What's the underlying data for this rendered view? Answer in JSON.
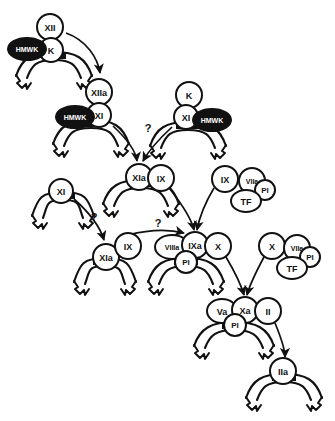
{
  "diagram": {
    "type": "biochemical-pathway",
    "background_color": "#ffffff",
    "stroke_color": "#111111",
    "dark_fill_color": "#111111",
    "light_fill_color": "#ffffff",
    "nodes": [
      {
        "id": "n1",
        "label": "XII",
        "shape": "circle",
        "style": "light",
        "cx": 50,
        "cy": 27,
        "r": 13,
        "font": 9
      },
      {
        "id": "n2",
        "label": "K",
        "shape": "circle",
        "style": "light",
        "cx": 51,
        "cy": 50,
        "r": 12,
        "font": 9
      },
      {
        "id": "n3",
        "label": "HMWK",
        "shape": "ellipse",
        "style": "dark",
        "cx": 27,
        "cy": 49,
        "rx": 19,
        "ry": 11,
        "font": 7
      },
      {
        "id": "n4",
        "label": "XIIa",
        "shape": "circle",
        "style": "light",
        "cx": 99,
        "cy": 92,
        "r": 13,
        "font": 9
      },
      {
        "id": "n5",
        "label": "XI",
        "shape": "circle",
        "style": "light",
        "cx": 99,
        "cy": 115,
        "r": 12,
        "font": 9
      },
      {
        "id": "n6",
        "label": "HMWK",
        "shape": "ellipse",
        "style": "dark",
        "cx": 75,
        "cy": 117,
        "rx": 19,
        "ry": 11,
        "font": 7
      },
      {
        "id": "n7",
        "label": "K",
        "shape": "circle",
        "style": "light",
        "cx": 189,
        "cy": 95,
        "r": 13,
        "font": 9
      },
      {
        "id": "n8",
        "label": "XI",
        "shape": "circle",
        "style": "light",
        "cx": 186,
        "cy": 117,
        "r": 12,
        "font": 9
      },
      {
        "id": "n9",
        "label": "HMWK",
        "shape": "ellipse",
        "style": "dark",
        "cx": 212,
        "cy": 120,
        "rx": 19,
        "ry": 11,
        "font": 7
      },
      {
        "id": "n10",
        "label": "XIa",
        "shape": "circle",
        "style": "light",
        "cx": 139,
        "cy": 177,
        "r": 13,
        "font": 9
      },
      {
        "id": "n11",
        "label": "IX",
        "shape": "circle",
        "style": "light",
        "cx": 161,
        "cy": 178,
        "r": 13,
        "font": 9
      },
      {
        "id": "n12",
        "label": "XI",
        "shape": "circle",
        "style": "light",
        "cx": 61,
        "cy": 191,
        "r": 12,
        "font": 9
      },
      {
        "id": "n13",
        "label": "XIa",
        "shape": "circle",
        "style": "light",
        "cx": 106,
        "cy": 257,
        "r": 13,
        "font": 9
      },
      {
        "id": "n14",
        "label": "IX",
        "shape": "circle",
        "style": "light",
        "cx": 128,
        "cy": 246,
        "r": 13,
        "font": 9
      },
      {
        "id": "n15",
        "label": "IX",
        "shape": "circle",
        "style": "light",
        "cx": 225,
        "cy": 179,
        "r": 13,
        "font": 9
      },
      {
        "id": "n16",
        "label": "VIIa",
        "shape": "circle",
        "style": "light",
        "cx": 252,
        "cy": 181,
        "r": 13,
        "font": 7
      },
      {
        "id": "n17",
        "label": "Pl",
        "shape": "circle",
        "style": "light",
        "cx": 265,
        "cy": 190,
        "r": 10,
        "font": 8
      },
      {
        "id": "n18",
        "label": "TF",
        "shape": "ellipse",
        "style": "light",
        "cx": 246,
        "cy": 201,
        "rx": 15,
        "ry": 11,
        "font": 9
      },
      {
        "id": "n19",
        "label": "VIIIa",
        "shape": "ellipse",
        "style": "light",
        "cx": 172,
        "cy": 247,
        "rx": 17,
        "ry": 12,
        "font": 7
      },
      {
        "id": "n20",
        "label": "IXa",
        "shape": "circle",
        "style": "light",
        "cx": 195,
        "cy": 245,
        "r": 13,
        "font": 9
      },
      {
        "id": "n21",
        "label": "Pl",
        "shape": "circle",
        "style": "light",
        "cx": 186,
        "cy": 262,
        "r": 11,
        "font": 8
      },
      {
        "id": "n22",
        "label": "X",
        "shape": "circle",
        "style": "light",
        "cx": 218,
        "cy": 246,
        "r": 13,
        "font": 9
      },
      {
        "id": "n23",
        "label": "X",
        "shape": "circle",
        "style": "light",
        "cx": 272,
        "cy": 246,
        "r": 13,
        "font": 9
      },
      {
        "id": "n24",
        "label": "VIIa",
        "shape": "circle",
        "style": "light",
        "cx": 297,
        "cy": 248,
        "r": 13,
        "font": 7
      },
      {
        "id": "n25",
        "label": "Pl",
        "shape": "circle",
        "style": "light",
        "cx": 310,
        "cy": 257,
        "r": 10,
        "font": 8
      },
      {
        "id": "n26",
        "label": "TF",
        "shape": "ellipse",
        "style": "light",
        "cx": 292,
        "cy": 268,
        "rx": 15,
        "ry": 11,
        "font": 9
      },
      {
        "id": "n27",
        "label": "Va",
        "shape": "ellipse",
        "style": "light",
        "cx": 222,
        "cy": 311,
        "rx": 15,
        "ry": 12,
        "font": 9
      },
      {
        "id": "n28",
        "label": "Xa",
        "shape": "circle",
        "style": "light",
        "cx": 245,
        "cy": 310,
        "r": 13,
        "font": 9
      },
      {
        "id": "n29",
        "label": "Pl",
        "shape": "circle",
        "style": "light",
        "cx": 235,
        "cy": 325,
        "r": 11,
        "font": 8
      },
      {
        "id": "n30",
        "label": "II",
        "shape": "circle",
        "style": "light",
        "cx": 268,
        "cy": 311,
        "r": 13,
        "font": 9
      },
      {
        "id": "n31",
        "label": "IIa",
        "shape": "circle",
        "style": "light",
        "cx": 283,
        "cy": 371,
        "r": 13,
        "font": 9
      }
    ],
    "membranes": [
      {
        "id": "m1",
        "cx": 54,
        "cy": 62,
        "w": 76,
        "note": "HMWK-K-XII surface"
      },
      {
        "id": "m2",
        "cx": 91,
        "cy": 130,
        "w": 76,
        "note": "HMWK-XI surface"
      },
      {
        "id": "m3",
        "cx": 188,
        "cy": 132,
        "w": 76,
        "note": "K-XI-HMWK surface"
      },
      {
        "id": "m4",
        "cx": 141,
        "cy": 190,
        "w": 76,
        "note": "XIa surface"
      },
      {
        "id": "m5",
        "cx": 63,
        "cy": 202,
        "w": 62,
        "note": "XI surface"
      },
      {
        "id": "m6",
        "cx": 105,
        "cy": 268,
        "w": 62,
        "note": "XIa surface lower"
      },
      {
        "id": "m7",
        "cx": 186,
        "cy": 268,
        "w": 76,
        "note": "tenase surface"
      },
      {
        "id": "m8",
        "cx": 234,
        "cy": 332,
        "w": 80,
        "note": "prothrombinase surface"
      },
      {
        "id": "m9",
        "cx": 284,
        "cy": 384,
        "w": 76,
        "note": "IIa surface"
      }
    ],
    "arrows": [
      {
        "id": "a1",
        "from": "XII",
        "to": "XIIa",
        "label": "",
        "path": "M 66 33 C 86 40, 98 58, 100 73"
      },
      {
        "id": "a2",
        "from": "HMWK-XI",
        "to": "XIa",
        "label": "",
        "path": "M 113 126 C 128 140, 136 152, 137 161"
      },
      {
        "id": "a3",
        "from": "K-XI-HMWK",
        "to": "XIa",
        "label": "?",
        "path": "M 172 127 C 158 140, 148 152, 143 161",
        "label_x": 148,
        "label_y": 132
      },
      {
        "id": "a4",
        "from": "XI",
        "to": "XIa-lower",
        "label": "?",
        "path": "M 74 199 C 92 215, 101 230, 104 240",
        "label_x": 94,
        "label_y": 221
      },
      {
        "id": "a5",
        "from": "XIa-IX",
        "to": "IXa",
        "label": "",
        "path": "M 170 189 C 184 207, 192 221, 194 230"
      },
      {
        "id": "a6",
        "from": "IX-VIIa-TF",
        "to": "IXa",
        "label": "",
        "path": "M 214 188 C 205 203, 199 219, 197 230"
      },
      {
        "id": "a7",
        "from": "XIa-IX-lower",
        "to": "IXa",
        "label": "?",
        "path": "M 128 235 C 152 229, 172 230, 184 233",
        "label_x": 158,
        "label_y": 227
      },
      {
        "id": "a8",
        "from": "X-tenase",
        "to": "Xa",
        "label": "",
        "path": "M 226 257 C 236 274, 242 288, 244 295"
      },
      {
        "id": "a9",
        "from": "X-VIIa-TF",
        "to": "Xa",
        "label": "",
        "path": "M 264 257 C 256 272, 249 287, 247 295"
      },
      {
        "id": "a10",
        "from": "II",
        "to": "IIa",
        "label": "",
        "path": "M 275 323 C 282 340, 285 352, 285 357"
      }
    ]
  }
}
